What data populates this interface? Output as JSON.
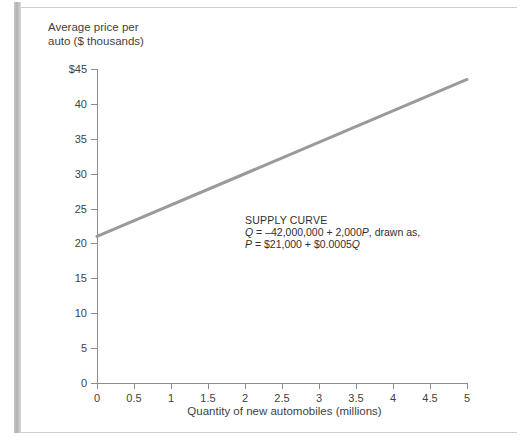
{
  "page": {
    "cutoff_caption": "      ",
    "background_color": "#ffffff"
  },
  "chart_data": {
    "type": "line",
    "title": "",
    "xlabel": "Quantity of new automobiles (millions)",
    "ylabel": "Average price per\nauto ($ thousands)",
    "xlim": [
      0,
      5
    ],
    "ylim": [
      0,
      45
    ],
    "grid": false,
    "legend_position": "none",
    "x_ticks": [
      "0",
      "0.5",
      "1",
      "1.5",
      "2",
      "2.5",
      "3",
      "3.5",
      "4",
      "4.5",
      "5"
    ],
    "x_tick_values": [
      0,
      0.5,
      1,
      1.5,
      2,
      2.5,
      3,
      3.5,
      4,
      4.5,
      5
    ],
    "y_ticks": [
      "0",
      "5",
      "10",
      "15",
      "20",
      "25",
      "30",
      "35",
      "40",
      "$45"
    ],
    "y_tick_values": [
      0,
      5,
      10,
      15,
      20,
      25,
      30,
      35,
      40,
      45
    ],
    "series": [
      {
        "name": "Supply curve",
        "color": "#9a9a9a",
        "linewidth": 3,
        "x": [
          0,
          0.5,
          1,
          1.5,
          2,
          2.5,
          3,
          3.5,
          4,
          4.5,
          5
        ],
        "values": [
          21,
          23.25,
          25.5,
          27.75,
          30,
          32.25,
          34.5,
          36.75,
          39,
          41.25,
          43.5
        ]
      }
    ],
    "annotations": [
      {
        "name": "supply-curve-note",
        "heading": "SUPPLY CURVE",
        "line1_prefix": "Q",
        "line1_body": " = –42,000,000 + 2,000",
        "line1_var": "P",
        "line1_suffix": ", drawn as,",
        "line2_prefix": "P",
        "line2_body": " = $21,000 + $0.0005",
        "line2_var": "Q",
        "x": 2.0,
        "y": 25.5
      }
    ]
  }
}
